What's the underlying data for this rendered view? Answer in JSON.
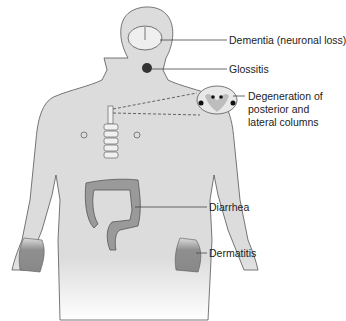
{
  "figure": {
    "labels": {
      "dementia": "Dementia (neuronal loss)",
      "glossitis": "Glossitis",
      "degeneration_line1": "Degeneration of",
      "degeneration_line2": "posterior and",
      "degeneration_line3": "lateral columns",
      "diarrhea": "Diarrhea",
      "dermatitis": "Dermatitis"
    },
    "colors": {
      "body": "#dcdcdc",
      "outline": "#555555",
      "affected": "#8f8f8f",
      "label_line": "#444444"
    }
  }
}
